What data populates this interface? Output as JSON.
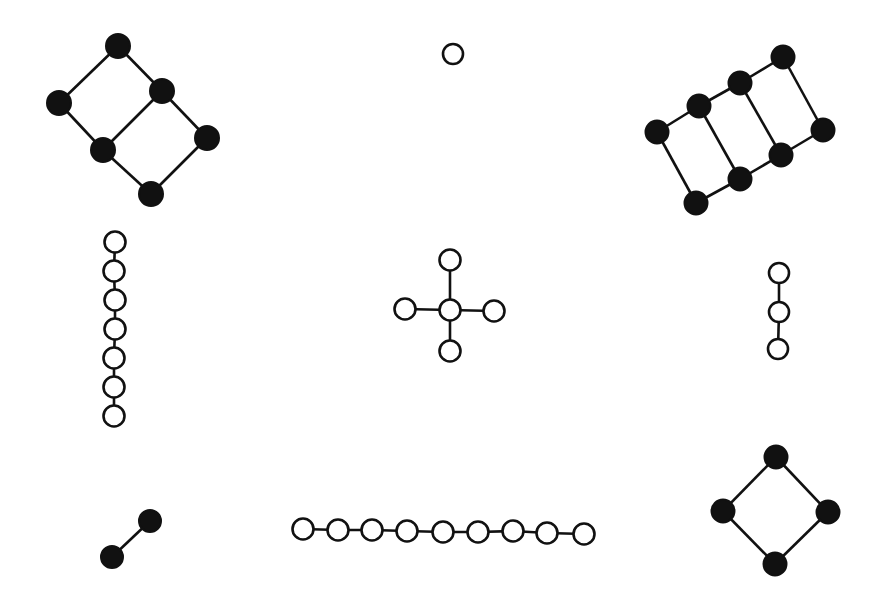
{
  "diagram": {
    "title": "",
    "background": "#ffffff",
    "colors": {
      "stroke": "#111111",
      "filled": "#111111",
      "open": "#ffffff"
    },
    "graphs": [
      {
        "id": "two-square-ladder",
        "style": "filled",
        "radius": 12,
        "nodes": [
          [
            118,
            46
          ],
          [
            59,
            103
          ],
          [
            162,
            91
          ],
          [
            103,
            150
          ],
          [
            207,
            138
          ],
          [
            151,
            194
          ]
        ],
        "edges": [
          [
            0,
            1
          ],
          [
            0,
            2
          ],
          [
            1,
            3
          ],
          [
            2,
            3
          ],
          [
            2,
            4
          ],
          [
            3,
            5
          ],
          [
            4,
            5
          ]
        ]
      },
      {
        "id": "single-vertex",
        "style": "open",
        "radius": 10,
        "nodes": [
          [
            453,
            54
          ]
        ],
        "edges": []
      },
      {
        "id": "three-square-ladder",
        "style": "filled",
        "radius": 11.5,
        "nodes": [
          [
            657,
            132
          ],
          [
            699,
            106
          ],
          [
            740,
            83
          ],
          [
            783,
            57
          ],
          [
            696,
            203
          ],
          [
            740,
            179
          ],
          [
            781,
            155
          ],
          [
            823,
            130
          ]
        ],
        "edges": [
          [
            0,
            1
          ],
          [
            1,
            2
          ],
          [
            2,
            3
          ],
          [
            4,
            5
          ],
          [
            5,
            6
          ],
          [
            6,
            7
          ],
          [
            0,
            4
          ],
          [
            1,
            5
          ],
          [
            2,
            6
          ],
          [
            3,
            7
          ]
        ]
      },
      {
        "id": "path-7",
        "style": "open",
        "radius": 10.5,
        "nodes": [
          [
            115,
            242
          ],
          [
            114,
            271
          ],
          [
            115,
            300
          ],
          [
            115,
            329
          ],
          [
            114,
            358
          ],
          [
            114,
            387
          ],
          [
            114,
            416
          ]
        ],
        "edges": [
          [
            0,
            1
          ],
          [
            1,
            2
          ],
          [
            2,
            3
          ],
          [
            3,
            4
          ],
          [
            4,
            5
          ],
          [
            5,
            6
          ]
        ]
      },
      {
        "id": "star-4",
        "style": "open",
        "radius": 10.5,
        "nodes": [
          [
            450,
            310
          ],
          [
            450,
            260
          ],
          [
            450,
            351
          ],
          [
            405,
            309
          ],
          [
            494,
            311
          ]
        ],
        "edges": [
          [
            0,
            1
          ],
          [
            0,
            2
          ],
          [
            0,
            3
          ],
          [
            0,
            4
          ]
        ]
      },
      {
        "id": "path-3",
        "style": "open",
        "radius": 10,
        "nodes": [
          [
            779,
            273
          ],
          [
            779,
            312
          ],
          [
            778,
            349
          ]
        ],
        "edges": [
          [
            0,
            1
          ],
          [
            1,
            2
          ]
        ]
      },
      {
        "id": "single-edge",
        "style": "filled",
        "radius": 11,
        "nodes": [
          [
            150,
            521
          ],
          [
            112,
            557
          ]
        ],
        "edges": [
          [
            0,
            1
          ]
        ]
      },
      {
        "id": "path-9",
        "style": "open",
        "radius": 10.5,
        "nodes": [
          [
            303,
            529
          ],
          [
            338,
            530
          ],
          [
            372,
            530
          ],
          [
            407,
            531
          ],
          [
            443,
            532
          ],
          [
            478,
            532
          ],
          [
            513,
            531
          ],
          [
            547,
            533
          ],
          [
            584,
            534
          ]
        ],
        "edges": [
          [
            0,
            1
          ],
          [
            1,
            2
          ],
          [
            2,
            3
          ],
          [
            3,
            4
          ],
          [
            4,
            5
          ],
          [
            5,
            6
          ],
          [
            6,
            7
          ],
          [
            7,
            8
          ]
        ]
      },
      {
        "id": "cycle-4",
        "style": "filled",
        "radius": 11.5,
        "nodes": [
          [
            776,
            457
          ],
          [
            723,
            511
          ],
          [
            828,
            512
          ],
          [
            775,
            564
          ]
        ],
        "edges": [
          [
            0,
            1
          ],
          [
            0,
            2
          ],
          [
            1,
            3
          ],
          [
            2,
            3
          ]
        ]
      }
    ]
  }
}
